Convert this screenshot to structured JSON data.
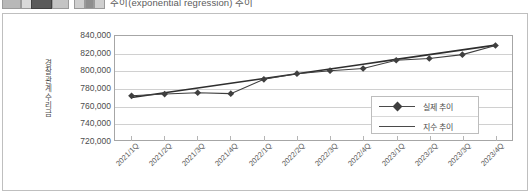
{
  "top_strip": {
    "cropped_title": "추이(exponential regression) 추이",
    "toolbar_icons": [
      "toolbar-chip-1",
      "toolbar-chip-2",
      "toolbar-chip-3",
      "toolbar-chip-4",
      "toolbar-chip-5",
      "toolbar-chip-6",
      "toolbar-chip-7"
    ]
  },
  "colors": {
    "series_actual": "#3f3f3f",
    "series_exponential": "#2e2e2e",
    "gridline": "#d0d0d0",
    "plot_border": "#a6a6a6",
    "figure_border": "#bfbfbf",
    "text": "#4d4d4d",
    "background": "#ffffff"
  },
  "chart_data": {
    "type": "line",
    "title": "",
    "xlabel": "",
    "ylabel": "경찰관계수리금",
    "grid": true,
    "legend_position": "inside-bottom-right",
    "ylim": [
      720000,
      840000
    ],
    "ytick_step": 20000,
    "ytick_labels": [
      "840,000",
      "820,000",
      "800,000",
      "780,000",
      "760,000",
      "740,000",
      "720,000"
    ],
    "ytick_values": [
      840000,
      820000,
      800000,
      780000,
      760000,
      740000,
      720000
    ],
    "categories": [
      "2021/1Q",
      "2021/2Q",
      "2021/3Q",
      "2021/4Q",
      "2022/1Q",
      "2022/2Q",
      "2022/3Q",
      "2022/4Q",
      "2023/1Q",
      "2023/2Q",
      "2023/3Q",
      "2023/4Q"
    ],
    "series": [
      {
        "name": "실제 추이",
        "marker": "diamond",
        "values": [
          771000,
          773000,
          774500,
          773500,
          790000,
          796500,
          800000,
          802500,
          812000,
          814000,
          818500,
          829000
        ]
      },
      {
        "name": "지수 추이",
        "marker": "none",
        "values": [
          769000,
          774500,
          780000,
          785500,
          791000,
          796500,
          802000,
          807500,
          813000,
          818500,
          824000,
          829500
        ]
      }
    ]
  }
}
